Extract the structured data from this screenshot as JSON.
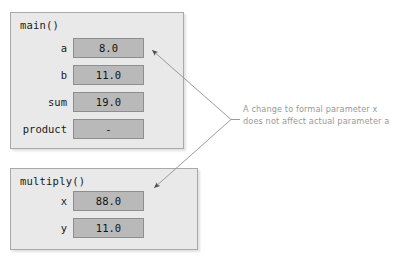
{
  "diagram": {
    "frames": [
      {
        "name": "main-frame",
        "title": "main()",
        "variables": [
          {
            "label": "a",
            "value": "8.0"
          },
          {
            "label": "b",
            "value": "11.0"
          },
          {
            "label": "sum",
            "value": "19.0"
          },
          {
            "label": "product",
            "value": "-"
          }
        ]
      },
      {
        "name": "multiply-frame",
        "title": "multiply()",
        "variables": [
          {
            "label": "x",
            "value": "88.0"
          },
          {
            "label": "y",
            "value": "11.0"
          }
        ]
      }
    ],
    "annotation": {
      "line1": "A change to formal parameter x",
      "line2": "does not affect actual parameter a"
    },
    "colors": {
      "page_background": "#ffffff",
      "frame_fill": "#e9e9e9",
      "frame_border": "#a9a9a9",
      "value_box_fill": "#b9b9b9",
      "value_box_border": "#8e8e8e",
      "text": "#1a1a1a",
      "annotation_text": "#9a9a9a",
      "connector": "#9a9a9a"
    }
  }
}
